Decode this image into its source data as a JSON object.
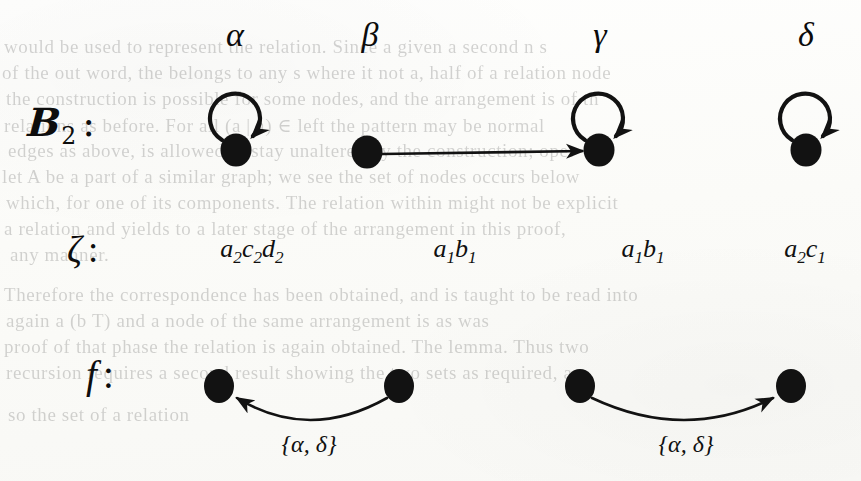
{
  "figure": {
    "caption_bleed_note": "scanned book page with reverse-side show-through",
    "ink_color": "#121212",
    "paper_color": "#fdfdfb"
  },
  "columns": [
    {
      "id": "alpha",
      "label": "α",
      "x": 235
    },
    {
      "id": "beta",
      "label": "β",
      "x": 370
    },
    {
      "id": "gamma",
      "label": "γ",
      "x": 600
    },
    {
      "id": "delta",
      "label": "δ",
      "x": 806
    }
  ],
  "rows": {
    "b2": {
      "label_letter": "B",
      "label_subscript": "2",
      "label_colon": ":"
    },
    "zeta": {
      "label_letter": "ζ",
      "label_colon": ":"
    },
    "f": {
      "label_letter": "f",
      "label_colon": ":"
    }
  },
  "b2_row": {
    "nodes": [
      {
        "id": "n-alpha",
        "x": 236,
        "y": 150,
        "self_loop": true
      },
      {
        "id": "n-beta",
        "x": 367,
        "y": 152,
        "self_loop": false
      },
      {
        "id": "n-gamma",
        "x": 599,
        "y": 150,
        "self_loop": true
      },
      {
        "id": "n-delta",
        "x": 806,
        "y": 150,
        "self_loop": true
      }
    ],
    "edges": [
      {
        "id": "edge-beta-gamma",
        "from": "n-beta",
        "to": "n-gamma",
        "kind": "straight",
        "direction": "right"
      }
    ],
    "self_loops": [
      {
        "id": "loop-alpha",
        "on": "n-alpha"
      },
      {
        "id": "loop-gamma",
        "on": "n-gamma"
      },
      {
        "id": "loop-delta",
        "on": "n-delta"
      }
    ]
  },
  "zeta_row": {
    "entries": [
      {
        "id": "zeta-alpha",
        "x": 252,
        "text": "a2c2d2",
        "parts": [
          {
            "base": "a",
            "sub": "2"
          },
          {
            "base": "c",
            "sub": "2"
          },
          {
            "base": "d",
            "sub": "2"
          }
        ]
      },
      {
        "id": "zeta-beta",
        "x": 455,
        "text": "a1b1",
        "parts": [
          {
            "base": "a",
            "sub": "1"
          },
          {
            "base": "b",
            "sub": "1"
          }
        ]
      },
      {
        "id": "zeta-gamma",
        "x": 643,
        "text": "a1b1",
        "parts": [
          {
            "base": "a",
            "sub": "1"
          },
          {
            "base": "b",
            "sub": "1"
          }
        ]
      },
      {
        "id": "zeta-delta",
        "x": 805,
        "text": "a2c1",
        "parts": [
          {
            "base": "a",
            "sub": "2"
          },
          {
            "base": "c",
            "sub": "1"
          }
        ]
      }
    ]
  },
  "f_row": {
    "nodes": [
      {
        "id": "f-n1",
        "x": 219,
        "y": 386
      },
      {
        "id": "f-n2",
        "x": 399,
        "y": 386
      },
      {
        "id": "f-n3",
        "x": 580,
        "y": 386
      },
      {
        "id": "f-n4",
        "x": 791,
        "y": 386
      }
    ],
    "edges": [
      {
        "id": "f-edge-left",
        "from": "f-n2",
        "to": "f-n1",
        "direction": "left",
        "label": "{α, δ}",
        "label_x": 309,
        "label_y": 432
      },
      {
        "id": "f-edge-right",
        "from": "f-n3",
        "to": "f-n4",
        "direction": "right",
        "label": "{α, δ}",
        "label_x": 686,
        "label_y": 432
      }
    ]
  },
  "bleed_text": {
    "lines": [
      {
        "x": 4,
        "y": 36,
        "text": "would be used to represent the relation. Since a given a second n s"
      },
      {
        "x": 2,
        "y": 62,
        "text": "of the out word, the belongs to any s where it not a, half of a relation node"
      },
      {
        "x": 6,
        "y": 88,
        "text": "the construction is possible for some nodes, and the arrangement is of th"
      },
      {
        "x": 4,
        "y": 114,
        "text": "relations as before. For all (a | a) ∈ left the pattern may be normal"
      },
      {
        "x": 8,
        "y": 140,
        "text": "edges as above, is allowed to stay unaltered by the construction; oper"
      },
      {
        "x": 2,
        "y": 166,
        "text": "let A be a part of a similar graph; we see the set of nodes occurs below"
      },
      {
        "x": 6,
        "y": 192,
        "text": "which, for one of its components. The relation within might not be explicit"
      },
      {
        "x": 4,
        "y": 218,
        "text": "a relation and yields to a later stage of the arrangement in this proof,"
      },
      {
        "x": 10,
        "y": 244,
        "text": "any manner."
      },
      {
        "x": 4,
        "y": 284,
        "text": "Therefore the correspondence has been obtained, and is taught to be read into"
      },
      {
        "x": 6,
        "y": 310,
        "text": "again a (b T) and a node of the same arrangement is as was"
      },
      {
        "x": 4,
        "y": 336,
        "text": "proof of that phase the relation is again obtained. The lemma. Thus two"
      },
      {
        "x": 6,
        "y": 362,
        "text": "recursion requires a second result showing the two sets as required, are"
      },
      {
        "x": 8,
        "y": 404,
        "text": "so the set of a relation"
      }
    ]
  }
}
